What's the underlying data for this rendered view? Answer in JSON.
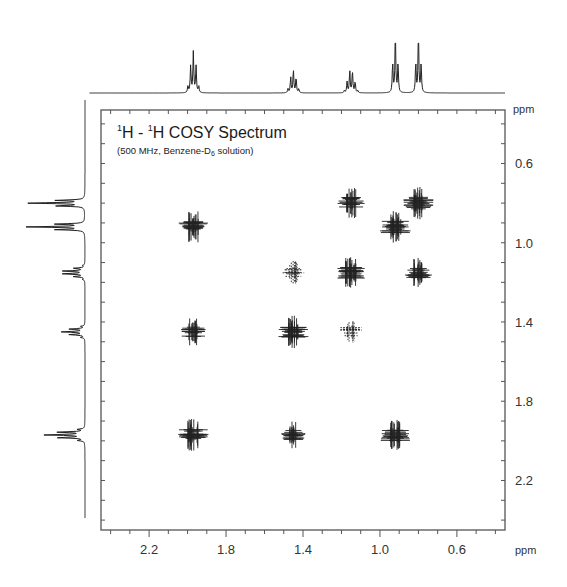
{
  "chart_data": {
    "type": "heatmap",
    "subtype": "2D NMR COSY contour plot with 1D projections",
    "title_parts": {
      "iso1": "1",
      "nuc1": "H",
      "sep": " - ",
      "iso2": "1",
      "nuc2": "H",
      "rest": " COSY Spectrum"
    },
    "subtitle": "(500 MHz, Benzene-D6 solution)",
    "subtitle_parts": {
      "pre": "(500 MHz, Benzene-D",
      "sub": "6",
      "post": " solution)"
    },
    "xlabel": "ppm",
    "ylabel": "ppm",
    "xlim": [
      2.45,
      0.35
    ],
    "ylim": [
      0.33,
      2.45
    ],
    "x_reversed": true,
    "y_increases_downward": true,
    "x_ticks": [
      2.2,
      1.8,
      1.4,
      1.0,
      0.6
    ],
    "x_tick_labels": [
      "2.2",
      "1.8",
      "1.4",
      "1.0",
      "0.6"
    ],
    "y_ticks": [
      0.6,
      1.0,
      1.4,
      1.8,
      2.2
    ],
    "y_tick_labels": [
      "0.6",
      "1.0",
      "1.4",
      "1.8",
      "2.2"
    ],
    "minor_tick_step": 0.1,
    "grid": false,
    "projection_1d": {
      "peaks": [
        {
          "shift": 1.97,
          "multiplicity": "quintet",
          "rel_height": 0.7
        },
        {
          "shift": 1.45,
          "multiplicity": "quintet",
          "rel_height": 0.4
        },
        {
          "shift": 1.15,
          "multiplicity": "sextet",
          "rel_height": 0.38
        },
        {
          "shift": 0.92,
          "multiplicity": "triplet",
          "rel_height": 1.0
        },
        {
          "shift": 0.8,
          "multiplicity": "triplet",
          "rel_height": 1.0
        }
      ]
    },
    "cross_peaks": [
      {
        "x": 1.97,
        "y": 0.92,
        "intensity": 0.9
      },
      {
        "x": 1.97,
        "y": 1.45,
        "intensity": 0.6
      },
      {
        "x": 1.97,
        "y": 1.97,
        "intensity": 1.0,
        "diagonal": true
      },
      {
        "x": 1.45,
        "y": 1.15,
        "intensity": 0.35
      },
      {
        "x": 1.45,
        "y": 1.45,
        "intensity": 1.0,
        "diagonal": true
      },
      {
        "x": 1.45,
        "y": 1.97,
        "intensity": 0.6
      },
      {
        "x": 1.15,
        "y": 0.8,
        "intensity": 0.8
      },
      {
        "x": 1.15,
        "y": 1.15,
        "intensity": 1.0,
        "diagonal": true
      },
      {
        "x": 1.15,
        "y": 1.45,
        "intensity": 0.35
      },
      {
        "x": 0.92,
        "y": 0.92,
        "intensity": 1.0,
        "diagonal": true
      },
      {
        "x": 0.92,
        "y": 1.97,
        "intensity": 0.9
      },
      {
        "x": 0.8,
        "y": 0.8,
        "intensity": 1.0,
        "diagonal": true
      },
      {
        "x": 0.8,
        "y": 1.15,
        "intensity": 0.8
      }
    ]
  },
  "style": {
    "line_color": "#222222",
    "frame_color": "#555555",
    "background": "#ffffff"
  }
}
